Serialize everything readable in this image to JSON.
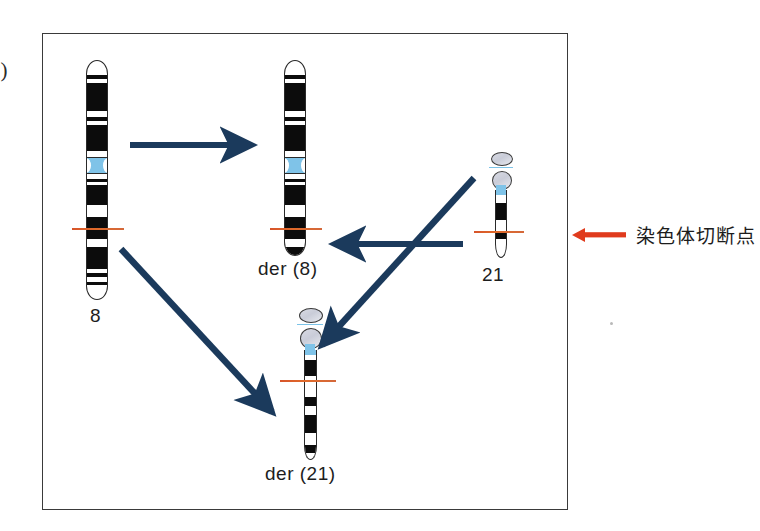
{
  "figure": {
    "panel_number": "2)",
    "background_color": "#ffffff",
    "frame_border_color": "#3a3a3a",
    "band_color": "#0c0c0c",
    "centromere_color": "#7fc3e8",
    "arrow_color": "#1b3a5c",
    "breakpoint_color": "#d7542a"
  },
  "chromosomes": [
    {
      "id": "chr8",
      "label": "8",
      "type": "submetacentric",
      "breakpoint": true
    },
    {
      "id": "der8",
      "label": "der (8)",
      "type": "submetacentric",
      "breakpoint": true
    },
    {
      "id": "chr21",
      "label": "21",
      "type": "acrocentric",
      "breakpoint": true
    },
    {
      "id": "der21",
      "label": "der (21)",
      "type": "acrocentric",
      "breakpoint": true
    }
  ],
  "arrows": [
    {
      "id": "arrow-8-to-der8",
      "from": "8",
      "to": "der(8)",
      "direction": "right"
    },
    {
      "id": "arrow-21-to-der8",
      "from": "21",
      "to": "der(8)",
      "direction": "left"
    },
    {
      "id": "arrow-8-to-der21",
      "from": "8",
      "to": "der(21)",
      "direction": "down-right"
    },
    {
      "id": "arrow-21-to-der21",
      "from": "21",
      "to": "der(21)",
      "direction": "down-left"
    }
  ],
  "legend": {
    "marker": "red-left-arrow",
    "text": "染色体切断点",
    "color": "#e03b1d"
  }
}
